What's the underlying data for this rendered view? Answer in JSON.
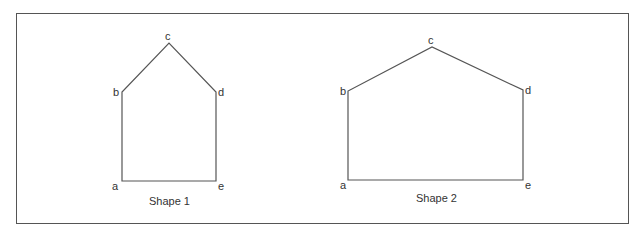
{
  "diagram": {
    "stroke_color": "#555555",
    "shapes": [
      {
        "caption": "Shape 1",
        "vertices": {
          "a": [
            122,
            181
          ],
          "b": [
            122,
            92
          ],
          "c": [
            169,
            43
          ],
          "d": [
            216,
            92
          ],
          "e": [
            216,
            181
          ]
        },
        "labels": {
          "a": "a",
          "b": "b",
          "c": "c",
          "d": "d",
          "e": "e"
        }
      },
      {
        "caption": "Shape 2",
        "vertices": {
          "a": [
            348,
            180
          ],
          "b": [
            348,
            91
          ],
          "c": [
            432,
            47
          ],
          "d": [
            523,
            90
          ],
          "e": [
            523,
            180
          ]
        },
        "labels": {
          "a": "a",
          "b": "b",
          "c": "c",
          "d": "d",
          "e": "e"
        }
      }
    ]
  }
}
